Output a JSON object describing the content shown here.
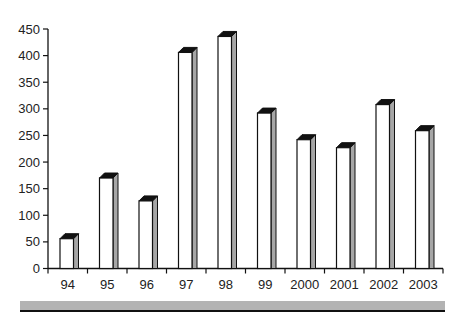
{
  "chart_data": {
    "type": "bar",
    "style": "3d-column",
    "title": "",
    "xlabel": "",
    "ylabel": "",
    "categories": [
      "94",
      "95",
      "96",
      "97",
      "98",
      "99",
      "2000",
      "2001",
      "2002",
      "2003"
    ],
    "values": [
      56,
      170,
      127,
      406,
      436,
      292,
      242,
      227,
      308,
      259
    ],
    "ylim": [
      0,
      450
    ],
    "yticks": [
      0,
      50,
      100,
      150,
      200,
      250,
      300,
      350,
      400,
      450
    ],
    "grid": false,
    "legend": null
  },
  "colors": {
    "bar_front": "#ffffff",
    "bar_side": "#a6a6a6",
    "bar_top": "#111111",
    "outline": "#111111",
    "strip": "#b3b3b3"
  }
}
